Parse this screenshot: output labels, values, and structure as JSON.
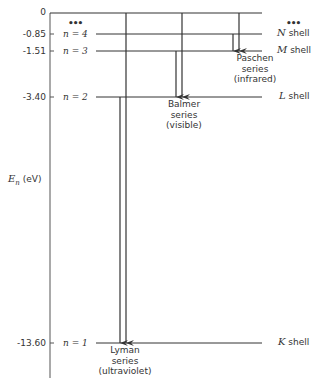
{
  "diagram": {
    "y_axis": {
      "symbol": "E",
      "subscript": "n",
      "unit": "(eV)",
      "ticks": [
        "0",
        "-0.85",
        "-1.51",
        "-3.40",
        "-13.60"
      ]
    },
    "levels": [
      {
        "n_label": "n = 4",
        "energy": "-0.85",
        "shell_letter": "N",
        "shell_word": "shell"
      },
      {
        "n_label": "n = 3",
        "energy": "-1.51",
        "shell_letter": "M",
        "shell_word": "shell"
      },
      {
        "n_label": "n = 2",
        "energy": "-3.40",
        "shell_letter": "L",
        "shell_word": "shell"
      },
      {
        "n_label": "n = 1",
        "energy": "-13.60",
        "shell_letter": "K",
        "shell_word": "shell"
      }
    ],
    "ellipsis": "•••",
    "series": [
      {
        "name": "Lyman",
        "word": "series",
        "region": "(ultraviolet)",
        "final_level": "n = 1"
      },
      {
        "name": "Balmer",
        "word": "series",
        "region": "(visible)",
        "final_level": "n = 2"
      },
      {
        "name": "Paschen",
        "word": "series",
        "region": "(infrared)",
        "final_level": "n = 3"
      }
    ],
    "colors": {
      "line": "#333333",
      "text": "#333333",
      "background": "#ffffff"
    }
  }
}
